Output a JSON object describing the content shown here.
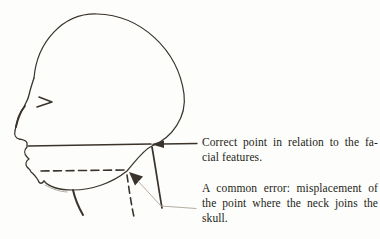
{
  "colors": {
    "ink": "#39332b",
    "pencil_light": "#b3ada3",
    "shade": "#b0aaa0",
    "text": "#241e17",
    "background": "#fdfdfb"
  },
  "captions": {
    "correct_point": {
      "lines": [
        "Correct point in relation to the fa-",
        "cial features."
      ]
    },
    "common_error": {
      "lines": [
        "A common error: misplacement of",
        "the point where the neck joins the",
        "skull."
      ]
    }
  }
}
